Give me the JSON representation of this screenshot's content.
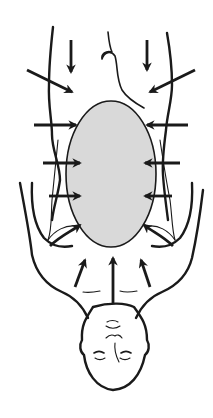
{
  "figure": {
    "type": "medical-illustration",
    "colors": {
      "background": "#ffffff",
      "line": "#1a1a1a",
      "pressure_region_fill": "#d9d9d9"
    },
    "pressure_region": {
      "shape": "ellipse",
      "cx": 111,
      "cy": 174,
      "rx": 45,
      "ry": 73
    },
    "arrows": [
      {
        "id": "top-left-down",
        "x1": 71,
        "y1": 40,
        "x2": 71,
        "y2": 72
      },
      {
        "id": "top-right-down",
        "x1": 147,
        "y1": 40,
        "x2": 147,
        "y2": 70
      },
      {
        "id": "upper-left-diag",
        "x1": 27,
        "y1": 70,
        "x2": 72,
        "y2": 92
      },
      {
        "id": "upper-right-diag",
        "x1": 195,
        "y1": 70,
        "x2": 150,
        "y2": 92
      },
      {
        "id": "left-1",
        "x1": 34,
        "y1": 125,
        "x2": 76,
        "y2": 125
      },
      {
        "id": "right-1",
        "x1": 188,
        "y1": 125,
        "x2": 147,
        "y2": 125
      },
      {
        "id": "left-2",
        "x1": 43,
        "y1": 163,
        "x2": 80,
        "y2": 163
      },
      {
        "id": "right-2",
        "x1": 180,
        "y1": 163,
        "x2": 145,
        "y2": 163
      },
      {
        "id": "left-3",
        "x1": 49,
        "y1": 196,
        "x2": 80,
        "y2": 196
      },
      {
        "id": "right-3",
        "x1": 172,
        "y1": 196,
        "x2": 145,
        "y2": 196
      },
      {
        "id": "lower-left-curve",
        "x1": 55,
        "y1": 238,
        "x2": 80,
        "y2": 225
      },
      {
        "id": "lower-right-curve",
        "x1": 168,
        "y1": 238,
        "x2": 144,
        "y2": 225
      },
      {
        "id": "bottom-left-up",
        "x1": 75,
        "y1": 287,
        "x2": 85,
        "y2": 260
      },
      {
        "id": "bottom-center-up",
        "x1": 113,
        "y1": 303,
        "x2": 113,
        "y2": 258
      },
      {
        "id": "bottom-right-up",
        "x1": 150,
        "y1": 287,
        "x2": 141,
        "y2": 260
      }
    ]
  }
}
